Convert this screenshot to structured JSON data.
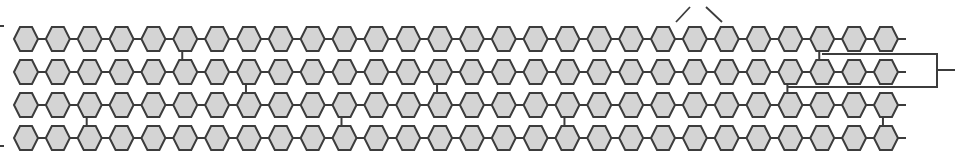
{
  "diagram": {
    "colors": {
      "ring_fill": "#d4d4d4",
      "stroke": "#3c3c3c",
      "background": "#ffffff"
    },
    "chains": {
      "count": 4,
      "rings_per_chain": 28,
      "row_centers_y": [
        39,
        72,
        105,
        138
      ],
      "first_ring_center_x": 26,
      "ring_spacing_x": 31.85,
      "ring_half_width": 12,
      "ring_half_height": 12,
      "tail_end_x": 906
    },
    "cross_links": [
      {
        "from_row": 0,
        "to_row": 1,
        "ring_index": 5
      },
      {
        "from_row": 0,
        "to_row": 1,
        "ring_index": 25
      },
      {
        "from_row": 1,
        "to_row": 2,
        "ring_index": 7
      },
      {
        "from_row": 1,
        "to_row": 2,
        "ring_index": 13
      },
      {
        "from_row": 1,
        "to_row": 2,
        "ring_index": 24
      },
      {
        "from_row": 2,
        "to_row": 3,
        "ring_index": 2
      },
      {
        "from_row": 2,
        "to_row": 3,
        "ring_index": 10
      },
      {
        "from_row": 2,
        "to_row": 3,
        "ring_index": 17
      },
      {
        "from_row": 2,
        "to_row": 3,
        "ring_index": 27
      }
    ],
    "bracket": {
      "top_start_x": 822,
      "top_y": 54,
      "right_x": 937,
      "bottom_start_x": 788,
      "bottom_y": 87,
      "stub_y": 70,
      "stub_end_x": 955
    },
    "pointers": [
      {
        "x1": 676,
        "y1": 22,
        "x2": 690,
        "y2": 7
      },
      {
        "x1": 722,
        "y1": 22,
        "x2": 706,
        "y2": 7
      }
    ],
    "left_ticks_y": [
      26,
      146
    ],
    "caption_top": "(partially cropped label above diagram)"
  }
}
